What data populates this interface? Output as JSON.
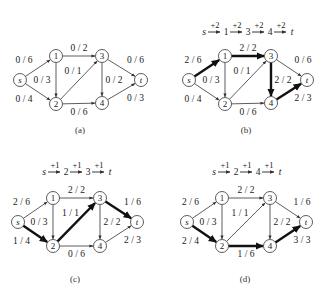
{
  "figure": {
    "node_labels": {
      "s": "s",
      "1": "1",
      "2": "2",
      "3": "3",
      "4": "4",
      "t": "t"
    },
    "panels": [
      {
        "id": "a",
        "caption": "(a)",
        "augmenting_path": null,
        "edges": [
          {
            "from": "s",
            "to": "1",
            "label": "0 / 6",
            "bold": false
          },
          {
            "from": "s",
            "to": "2",
            "label": "0 / 4",
            "bold": false
          },
          {
            "from": "1",
            "to": "2",
            "label": "0 / 3",
            "bold": false
          },
          {
            "from": "1",
            "to": "3",
            "label": "0 / 2",
            "bold": false
          },
          {
            "from": "2",
            "to": "3",
            "label": "0 / 1",
            "bold": false
          },
          {
            "from": "2",
            "to": "4",
            "label": "0 / 6",
            "bold": false
          },
          {
            "from": "3",
            "to": "4",
            "label": "0 / 2",
            "bold": false
          },
          {
            "from": "3",
            "to": "t",
            "label": "0 / 6",
            "bold": false
          },
          {
            "from": "4",
            "to": "t",
            "label": "0 / 3",
            "bold": false
          }
        ]
      },
      {
        "id": "b",
        "caption": "(b)",
        "augmenting_path": {
          "nodes": [
            "s",
            "1",
            "3",
            "4",
            "t"
          ],
          "increments": [
            "+2",
            "+2",
            "+2",
            "+2"
          ]
        },
        "edges": [
          {
            "from": "s",
            "to": "1",
            "label": "2 / 6",
            "bold": true
          },
          {
            "from": "s",
            "to": "2",
            "label": "0 / 4",
            "bold": false
          },
          {
            "from": "1",
            "to": "2",
            "label": "0 / 3",
            "bold": false
          },
          {
            "from": "1",
            "to": "3",
            "label": "2 / 2",
            "bold": true
          },
          {
            "from": "2",
            "to": "3",
            "label": "0 / 1",
            "bold": false
          },
          {
            "from": "2",
            "to": "4",
            "label": "0 / 6",
            "bold": false
          },
          {
            "from": "3",
            "to": "4",
            "label": "2 / 2",
            "bold": true
          },
          {
            "from": "3",
            "to": "t",
            "label": "0 / 6",
            "bold": false
          },
          {
            "from": "4",
            "to": "t",
            "label": "2 / 3",
            "bold": true
          }
        ]
      },
      {
        "id": "c",
        "caption": "(c)",
        "augmenting_path": {
          "nodes": [
            "s",
            "2",
            "3",
            "t"
          ],
          "increments": [
            "+1",
            "+1",
            "+1"
          ]
        },
        "edges": [
          {
            "from": "s",
            "to": "1",
            "label": "2 / 6",
            "bold": false
          },
          {
            "from": "s",
            "to": "2",
            "label": "1 / 4",
            "bold": true
          },
          {
            "from": "1",
            "to": "2",
            "label": "0 / 3",
            "bold": false
          },
          {
            "from": "1",
            "to": "3",
            "label": "2 / 2",
            "bold": false
          },
          {
            "from": "2",
            "to": "3",
            "label": "1 / 1",
            "bold": true
          },
          {
            "from": "2",
            "to": "4",
            "label": "0 / 6",
            "bold": false
          },
          {
            "from": "3",
            "to": "4",
            "label": "2 / 2",
            "bold": false
          },
          {
            "from": "3",
            "to": "t",
            "label": "1 / 6",
            "bold": true
          },
          {
            "from": "4",
            "to": "t",
            "label": "2 / 3",
            "bold": false
          }
        ]
      },
      {
        "id": "d",
        "caption": "(d)",
        "augmenting_path": {
          "nodes": [
            "s",
            "2",
            "4",
            "t"
          ],
          "increments": [
            "+1",
            "+1",
            "+1"
          ]
        },
        "edges": [
          {
            "from": "s",
            "to": "1",
            "label": "2 / 6",
            "bold": false
          },
          {
            "from": "s",
            "to": "2",
            "label": "2 / 4",
            "bold": true
          },
          {
            "from": "1",
            "to": "2",
            "label": "0 / 3",
            "bold": false
          },
          {
            "from": "1",
            "to": "3",
            "label": "2 / 2",
            "bold": false
          },
          {
            "from": "2",
            "to": "3",
            "label": "1 / 1",
            "bold": false
          },
          {
            "from": "2",
            "to": "4",
            "label": "1 / 6",
            "bold": true
          },
          {
            "from": "3",
            "to": "4",
            "label": "2 / 2",
            "bold": false
          },
          {
            "from": "3",
            "to": "t",
            "label": "1 / 6",
            "bold": false
          },
          {
            "from": "4",
            "to": "t",
            "label": "3 / 3",
            "bold": true
          }
        ]
      }
    ]
  },
  "colors": {
    "stroke": "#333333",
    "bold_stroke": "#111111",
    "node_fill": "#ffffff",
    "text": "#222222"
  }
}
